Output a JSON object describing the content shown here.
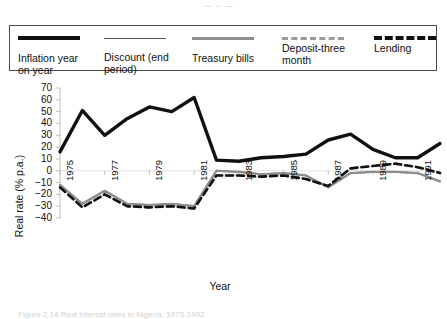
{
  "top_fragment": "— -- —",
  "legend": {
    "items": [
      {
        "label": "Inflation year\non year",
        "style": "solid-thick",
        "color": "#111111",
        "name": "inflation-year-on-year"
      },
      {
        "label": "Discount (end\nperiod)",
        "style": "solid-thin",
        "color": "#555555",
        "name": "discount-end-period"
      },
      {
        "label": "Treasury bills",
        "style": "solid-gray",
        "color": "#8d8d8d",
        "name": "treasury-bills"
      },
      {
        "label": "Deposit-three\nmonth",
        "style": "dash-gray",
        "color": "#9a9a9a",
        "name": "deposit-three-month"
      },
      {
        "label": "Lending",
        "style": "dash-black",
        "color": "#111111",
        "name": "lending"
      }
    ]
  },
  "caption": "Figure 2.14  Real interest rates in Nigeria, 1975-1992",
  "chart_data": {
    "type": "line",
    "title": "",
    "xlabel": "Year",
    "ylabel": "Real rate (% p.a.)",
    "xlim": [
      1975,
      1992
    ],
    "ylim": [
      -40,
      70
    ],
    "ytick_step": 10,
    "yticks": [
      70,
      60,
      50,
      40,
      30,
      20,
      10,
      0,
      -10,
      -20,
      -30,
      -40
    ],
    "xticks": [
      1975,
      1977,
      1979,
      1981,
      1983,
      1985,
      1987,
      1989,
      1991
    ],
    "xtick_labels": [
      "1975",
      "1977",
      "1979",
      "1981",
      "1983",
      "1985",
      "1987",
      "1989",
      "1991"
    ],
    "grid": false,
    "legend_position": "top",
    "x": [
      1975,
      1976,
      1977,
      1978,
      1979,
      1980,
      1981,
      1982,
      1983,
      1984,
      1985,
      1986,
      1987,
      1988,
      1989,
      1990,
      1991,
      1992
    ],
    "series": [
      {
        "name": "Inflation year on year",
        "color": "#111111",
        "style": "solid",
        "width": 3.4,
        "values": [
          16,
          51,
          30,
          44,
          54,
          50,
          62,
          9,
          8,
          11,
          12,
          14,
          26,
          31,
          18,
          11,
          11,
          23
        ]
      },
      {
        "name": "Discount (end period)",
        "color": "#8d8d8d",
        "style": "solid",
        "width": 1.8,
        "values": [
          -12,
          -28,
          -17,
          -28,
          -29,
          -28,
          -30,
          0,
          -1,
          -3,
          -2,
          -4,
          -14,
          -2,
          -1,
          -1,
          -2,
          -9
        ]
      },
      {
        "name": "Treasury bills",
        "color": "#8d8d8d",
        "style": "solid",
        "width": 2.2,
        "values": [
          -12,
          -28,
          -17,
          -28,
          -29,
          -28,
          -30,
          0,
          -1,
          -3,
          -2,
          -4,
          -14,
          -2,
          -1,
          -1,
          -2,
          -9
        ]
      },
      {
        "name": "Deposit-three month",
        "color": "#9a9a9a",
        "style": "dashed",
        "width": 2.2,
        "values": [
          -14,
          -31,
          -20,
          -30,
          -31,
          -30,
          -32,
          -4,
          -4,
          -5,
          -4,
          -7,
          -13,
          2,
          4,
          6,
          3,
          -2
        ]
      },
      {
        "name": "Lending",
        "color": "#111111",
        "style": "dashed",
        "width": 2.6,
        "values": [
          -14,
          -31,
          -20,
          -30,
          -31,
          -30,
          -32,
          -4,
          -4,
          -5,
          -4,
          -7,
          -13,
          2,
          4,
          6,
          3,
          -2
        ]
      }
    ]
  }
}
